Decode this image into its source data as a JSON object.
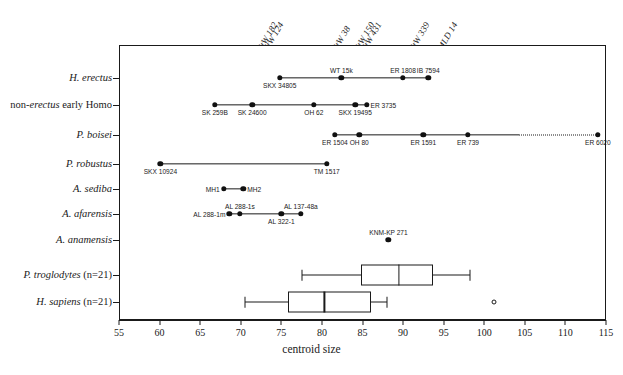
{
  "chart_data": {
    "type": "scatter",
    "title": "",
    "xlabel": "centroid size",
    "ylabel": "",
    "xlim": [
      55,
      115
    ],
    "xticks": [
      55,
      60,
      65,
      70,
      75,
      80,
      85,
      90,
      95,
      100,
      105,
      110,
      115
    ],
    "grid": "vertical dotted reference lines only",
    "legend": "none",
    "categories": [
      "H. erectus",
      "non-erectus early Homo",
      "P. boisei",
      "P. robustus",
      "A. sediba",
      "A. afarensis",
      "A. anamensis",
      "P. troglodytes (n=21)",
      "H. sapiens (n=21)"
    ],
    "reference_lines": [
      {
        "label": "StW 182",
        "value": 72.6
      },
      {
        "label": "StW 124",
        "value": 73.4
      },
      {
        "label": "StW 38",
        "value": 81.8
      },
      {
        "label": "StW 150",
        "value": 84.6
      },
      {
        "label": "StW 431",
        "value": 85.4
      },
      {
        "label": "StW 339",
        "value": 91.3
      },
      {
        "label": "MLD 14",
        "value": 94.8
      }
    ],
    "series": [
      {
        "name": "H. erectus",
        "plot": "range-points",
        "range": [
          74.8,
          93.1
        ],
        "points": [
          {
            "name": "SKX 34805",
            "value": 74.8,
            "label_pos": "below"
          },
          {
            "name": "WT 15k",
            "value": 82.4,
            "label_pos": "above"
          },
          {
            "name": "ER 1808",
            "value": 90.0,
            "label_pos": "above"
          },
          {
            "name": "IB 7594",
            "value": 93.1,
            "label_pos": "above"
          }
        ]
      },
      {
        "name": "non-erectus early Homo",
        "plot": "range-points",
        "range": [
          66.8,
          85.5
        ],
        "points": [
          {
            "name": "SK 259B",
            "value": 66.8,
            "label_pos": "below"
          },
          {
            "name": "SK 24600",
            "value": 71.4,
            "label_pos": "below"
          },
          {
            "name": "OH 62",
            "value": 79.0,
            "label_pos": "below"
          },
          {
            "name": "SKX 19495",
            "value": 84.1,
            "label_pos": "below"
          },
          {
            "name": "ER 3735",
            "value": 85.5,
            "label_pos": "right"
          }
        ]
      },
      {
        "name": "P. boisei",
        "plot": "range-points",
        "range": [
          81.6,
          114.0
        ],
        "dotted_segment": [
          104.3,
          114.0
        ],
        "points": [
          {
            "name": "ER 1504",
            "value": 81.6,
            "label_pos": "below"
          },
          {
            "name": "OH 80",
            "value": 84.6,
            "label_pos": "below"
          },
          {
            "name": "ER 1591",
            "value": 92.5,
            "label_pos": "below"
          },
          {
            "name": "ER 739",
            "value": 98.0,
            "label_pos": "below"
          },
          {
            "name": "ER 6020",
            "value": 114.0,
            "label_pos": "below"
          }
        ]
      },
      {
        "name": "P. robustus",
        "plot": "range-points",
        "range": [
          60.1,
          80.6
        ],
        "points": [
          {
            "name": "SKX 10924",
            "value": 60.1,
            "label_pos": "below"
          },
          {
            "name": "TM 1517",
            "value": 80.6,
            "label_pos": "below"
          }
        ]
      },
      {
        "name": "A. sediba",
        "plot": "range-points",
        "range": [
          67.9,
          70.3
        ],
        "points": [
          {
            "name": "MH1",
            "value": 67.9,
            "label_pos": "left"
          },
          {
            "name": "MH2",
            "value": 70.3,
            "label_pos": "right"
          }
        ]
      },
      {
        "name": "A. afarensis",
        "plot": "range-points",
        "range": [
          68.6,
          77.4
        ],
        "points": [
          {
            "name": "AL 288-1m",
            "value": 68.6,
            "label_pos": "left"
          },
          {
            "name": "AL 288-1s",
            "value": 69.9,
            "label_pos": "above"
          },
          {
            "name": "AL 322-1",
            "value": 75.0,
            "label_pos": "below"
          },
          {
            "name": "AL 137-48a",
            "value": 77.4,
            "label_pos": "above"
          }
        ]
      },
      {
        "name": "A. anamensis",
        "plot": "range-points",
        "range": [
          88.2,
          88.2
        ],
        "points": [
          {
            "name": "KNM-KP 271",
            "value": 88.2,
            "label_pos": "above"
          }
        ]
      },
      {
        "name": "P. troglodytes (n=21)",
        "plot": "boxplot",
        "box": {
          "min": 77.5,
          "q1": 84.8,
          "median": 89.5,
          "q3": 93.7,
          "max": 98.3
        },
        "outliers": []
      },
      {
        "name": "H. sapiens (n=21)",
        "plot": "boxplot",
        "box": {
          "min": 70.5,
          "q1": 75.8,
          "median": 80.3,
          "q3": 86.0,
          "max": 88.0
        },
        "outliers": [
          101.2
        ]
      }
    ]
  },
  "axis": {
    "x_title": "centroid size",
    "tick_labels": [
      "55",
      "60",
      "65",
      "70",
      "75",
      "80",
      "85",
      "90",
      "95",
      "100",
      "105",
      "110",
      "115"
    ]
  },
  "categories_display": [
    {
      "pre": "",
      "italic": "H. erectus",
      "post": ""
    },
    {
      "pre": "non-",
      "italic": "erectus",
      "post": " early Homo"
    },
    {
      "pre": "",
      "italic": "P. boisei",
      "post": ""
    },
    {
      "pre": "",
      "italic": "P. robustus",
      "post": ""
    },
    {
      "pre": "",
      "italic": "A. sediba",
      "post": ""
    },
    {
      "pre": "",
      "italic": "A. afarensis",
      "post": ""
    },
    {
      "pre": "",
      "italic": "A. anamensis",
      "post": ""
    },
    {
      "pre": "",
      "italic": "P. troglodytes",
      "post": " (n=21)"
    },
    {
      "pre": "",
      "italic": "H. sapiens",
      "post": " (n=21)"
    }
  ]
}
